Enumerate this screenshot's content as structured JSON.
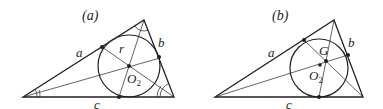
{
  "panels": [
    {
      "id": "a",
      "title": "(a)",
      "side_labels": {
        "a": "a",
        "b": "b",
        "c": "c"
      },
      "center_label": "O",
      "center_subscript": "2",
      "radius_label": "r",
      "description": "Triangle with inscribed circle; angle bisectors meet at incenter O2; tangent points marked"
    },
    {
      "id": "b",
      "title": "(b)",
      "side_labels": {
        "a": "a",
        "b": "b",
        "c": "c"
      },
      "centroid_label": "G",
      "center_label": "O",
      "center_subscript": "2",
      "description": "Triangle with inscribed circle; cevians through tangent points meet at point G; incenter O2 marked"
    }
  ]
}
